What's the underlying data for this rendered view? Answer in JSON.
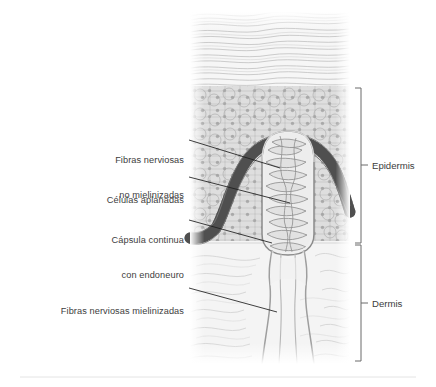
{
  "figure": {
    "background_color": "#ffffff",
    "panel": {
      "x": 190,
      "y": 12,
      "width": 160,
      "height": 352,
      "fill_light": "#f2f2f2",
      "fill_mid": "#dcdcdc",
      "outline_color": "#9a9a9a"
    },
    "layers": [
      {
        "name": "stratum-corneum",
        "pattern": "wavy-horizontal-flattened-cells",
        "y_top": 14,
        "y_bottom": 88,
        "fill": "#f4f4f4",
        "line_color": "#b4b4b4"
      },
      {
        "name": "stratum-spinosum-granulosum",
        "pattern": "polygonal-cells-with-nuclei",
        "y_top": 88,
        "y_bottom": 240,
        "fill": "#dedede",
        "line_color": "#9e9e9e"
      },
      {
        "name": "stratum-basale",
        "pattern": "dark-columnar-palisade",
        "fill": "#6e6e6e",
        "line_color": "#4a4a4a"
      },
      {
        "name": "dermis",
        "pattern": "loose-connective-fibers",
        "y_top": 243,
        "y_bottom": 364,
        "fill": "#f3f3f3",
        "line_color": "#c3c3c3"
      }
    ],
    "corpuscle": {
      "name": "meissner-corpuscle",
      "center_x": 288,
      "y_top": 133,
      "y_bottom": 250,
      "capsule_color": "#8c8c8c",
      "lamellae_fill": "#e6e6e6",
      "lamellae_line": "#8a8a8a"
    },
    "nerve_fiber": {
      "name": "myelinated-nerve-fiber",
      "x": 288,
      "y_top": 250,
      "y_bottom": 364,
      "color": "#a8a8a8"
    },
    "footer_rule": {
      "y": 377,
      "color": "#e2e2e2"
    }
  },
  "callouts": [
    {
      "id": "fibras-no-mielinizadas",
      "lines": [
        "Fibras nerviosas",
        "no mielinizadas"
      ],
      "text_x": 80,
      "text_y": 132,
      "text_width": 104,
      "leader": {
        "x1": 189,
        "y1": 140,
        "x2": 280,
        "y2": 168
      }
    },
    {
      "id": "celulas-aplanadas",
      "lines": [
        "Células aplanadas"
      ],
      "text_x": 80,
      "text_y": 172,
      "text_width": 104,
      "leader": {
        "x1": 189,
        "y1": 177,
        "x2": 290,
        "y2": 203
      }
    },
    {
      "id": "capsula-continua",
      "lines": [
        "Cápsula continua",
        "con endoneuro"
      ],
      "text_x": 70,
      "text_y": 212,
      "text_width": 114,
      "leader": {
        "x1": 189,
        "y1": 220,
        "x2": 272,
        "y2": 243
      }
    },
    {
      "id": "fibras-mielinizadas",
      "lines": [
        "Fibras nerviosas mielinizadas"
      ],
      "text_x": 18,
      "text_y": 283,
      "text_width": 166,
      "leader": {
        "x1": 189,
        "y1": 288,
        "x2": 277,
        "y2": 312
      }
    }
  ],
  "brackets": [
    {
      "id": "epidermis",
      "label": "Epidermis",
      "x": 361,
      "y_top": 88,
      "y_bottom": 243,
      "tick_y": 165,
      "label_x": 372,
      "label_y": 160,
      "color": "#6b6b6b"
    },
    {
      "id": "dermis",
      "label": "Dermis",
      "x": 361,
      "y_top": 245,
      "y_bottom": 361,
      "tick_y": 303,
      "label_x": 372,
      "label_y": 298,
      "color": "#6b6b6b"
    }
  ],
  "leader_line_color": "#1d1d1d"
}
